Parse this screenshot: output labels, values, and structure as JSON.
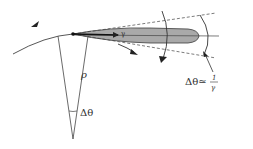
{
  "diagram": {
    "labels": {
      "rho": "ρ",
      "delta_theta": "Δθ",
      "formula_lhs": "Δθ≃",
      "formula_num": "1",
      "formula_den": "γ",
      "gamma_mark": "γ"
    },
    "colors": {
      "line": "#333333",
      "lobe_fill": "#a9a9a9",
      "lobe_stroke": "#3a3a3a",
      "background": "#ffffff"
    }
  }
}
